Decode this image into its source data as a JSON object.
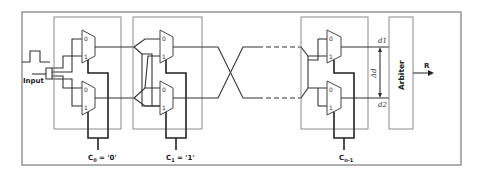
{
  "diagram": {
    "type": "arbiter-puf-circuit",
    "input_label": "Input",
    "stages": [
      {
        "id": "stage-0",
        "control_label_base": "C",
        "control_label_sub": "0",
        "control_label_value": " = '0'",
        "mux_inputs": [
          "0",
          "1"
        ]
      },
      {
        "id": "stage-1",
        "control_label_base": "C",
        "control_label_sub": "1",
        "control_label_value": " = '1'",
        "mux_inputs": [
          "0",
          "1"
        ]
      },
      {
        "id": "stage-n-1",
        "control_label_base": "C",
        "control_label_sub": "n-1",
        "control_label_value": "",
        "mux_inputs": [
          "0",
          "1"
        ]
      }
    ],
    "mux_labels": {
      "top": "0",
      "bottom": "1"
    },
    "delay_labels": {
      "top": "d1",
      "bottom": "d2",
      "difference": "Δd"
    },
    "arbiter_label": "Arbiter",
    "output_label": "R"
  }
}
